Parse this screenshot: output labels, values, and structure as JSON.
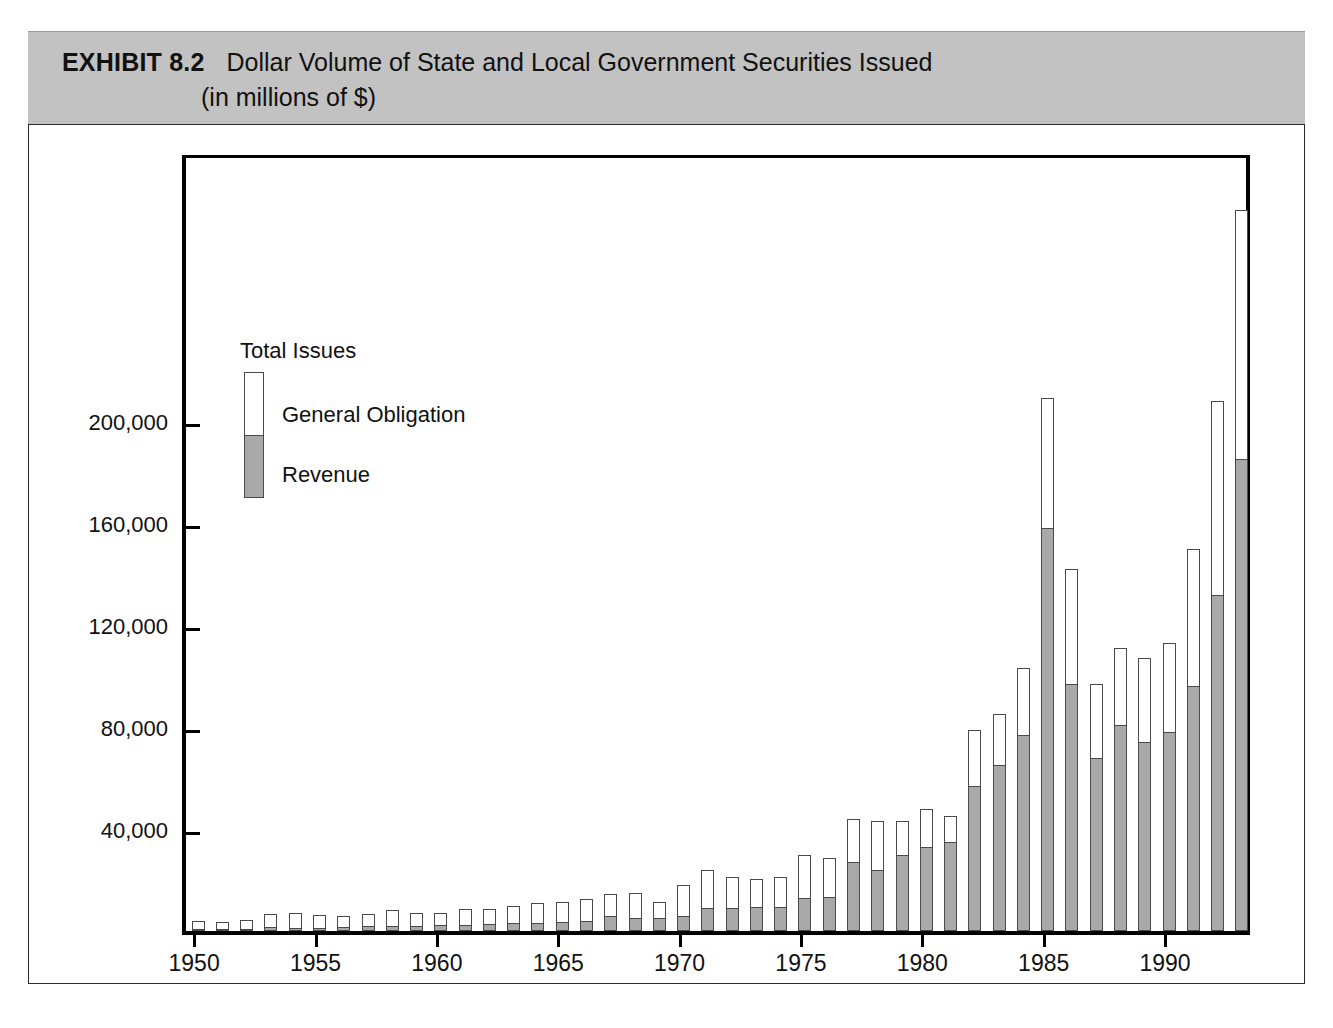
{
  "exhibit": {
    "label": "EXHIBIT 8.2",
    "title": "Dollar Volume of State and Local Government Securities Issued",
    "subtitle": "(in millions of $)"
  },
  "legend": {
    "title": "Total Issues",
    "items": [
      {
        "label": "General Obligation",
        "color": "#ffffff"
      },
      {
        "label": "Revenue",
        "color": "#a9a9a9"
      }
    ]
  },
  "colors": {
    "header_band": "#c2c2c2",
    "revenue": "#a9a9a9",
    "general_obligation": "#ffffff",
    "axis": "#000000",
    "bar_outline": "#4a4a4a"
  },
  "chart_data": {
    "type": "bar",
    "stacked": true,
    "title": "Dollar Volume of State and Local Government Securities Issued (in millions of $)",
    "xlabel": "",
    "ylabel": "",
    "ylim": [
      0,
      306000
    ],
    "yticks": [
      40000,
      80000,
      120000,
      160000,
      200000
    ],
    "ytick_labels": [
      "40,000",
      "80,000",
      "120,000",
      "160,000",
      "200,000"
    ],
    "xticks": [
      1950,
      1955,
      1960,
      1965,
      1970,
      1975,
      1980,
      1985,
      1990
    ],
    "xtick_labels": [
      "1950",
      "1955",
      "1960",
      "1965",
      "1970",
      "1975",
      "1980",
      "1985",
      "1990"
    ],
    "grid": false,
    "legend_position": "inside-upper-left",
    "categories": [
      1950,
      1951,
      1952,
      1953,
      1954,
      1955,
      1956,
      1957,
      1958,
      1959,
      1960,
      1961,
      1962,
      1963,
      1964,
      1965,
      1966,
      1967,
      1968,
      1969,
      1970,
      1971,
      1972,
      1973,
      1974,
      1975,
      1976,
      1977,
      1978,
      1979,
      1980,
      1981,
      1982,
      1983,
      1984,
      1985,
      1986,
      1987,
      1988,
      1989,
      1990,
      1991,
      1992,
      1993
    ],
    "series": [
      {
        "name": "Revenue",
        "color": "#a9a9a9",
        "values": [
          300,
          400,
          600,
          1600,
          1100,
          1200,
          1600,
          1800,
          1900,
          2000,
          2200,
          2500,
          2700,
          3000,
          3300,
          3600,
          4100,
          6000,
          5000,
          5300,
          6000,
          9000,
          9000,
          9400,
          9600,
          13000,
          13500,
          27000,
          24000,
          30000,
          33000,
          35000,
          57000,
          65000,
          77000,
          158000,
          97000,
          68000,
          81000,
          74000,
          78000,
          96000,
          132000,
          185000
        ]
      },
      {
        "name": "General Obligation",
        "color": "#ffffff",
        "values": [
          3500,
          3000,
          3900,
          5000,
          5800,
          4900,
          4100,
          5000,
          6500,
          5000,
          5000,
          6000,
          6000,
          7000,
          7500,
          7800,
          8500,
          8500,
          10000,
          6000,
          12000,
          15000,
          12000,
          11000,
          11500,
          17000,
          15000,
          17000,
          19000,
          13000,
          15000,
          10000,
          22000,
          20000,
          26000,
          51000,
          45000,
          29000,
          30000,
          33000,
          35000,
          54000,
          76000,
          98000
        ]
      }
    ]
  }
}
